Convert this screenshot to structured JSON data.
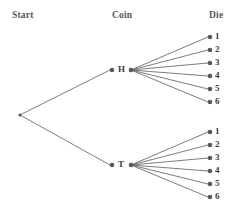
{
  "diagram": {
    "type": "probability-tree",
    "title_row": {
      "start": "Start",
      "coin": "Coin",
      "die": "Die"
    },
    "colors": {
      "edge": "#6d6d72",
      "node": "#58585c",
      "header_text": "#58585a",
      "label_text": "#3a3a3c",
      "background": "#ffffff"
    },
    "root": {
      "name": "start-node",
      "x": 20,
      "y": 115
    },
    "coin_branches": [
      {
        "label": "H",
        "node_x": 112,
        "node_y": 70,
        "fan_x": 131,
        "fan_y": 70,
        "die_outcomes": [
          {
            "label": "1",
            "x": 210,
            "y": 37
          },
          {
            "label": "2",
            "x": 210,
            "y": 50
          },
          {
            "label": "3",
            "x": 210,
            "y": 63
          },
          {
            "label": "4",
            "x": 210,
            "y": 76
          },
          {
            "label": "5",
            "x": 210,
            "y": 89
          },
          {
            "label": "6",
            "x": 210,
            "y": 102
          }
        ]
      },
      {
        "label": "T",
        "node_x": 112,
        "node_y": 165,
        "fan_x": 131,
        "fan_y": 165,
        "die_outcomes": [
          {
            "label": "1",
            "x": 210,
            "y": 132
          },
          {
            "label": "2",
            "x": 210,
            "y": 145
          },
          {
            "label": "3",
            "x": 210,
            "y": 158
          },
          {
            "label": "4",
            "x": 210,
            "y": 171
          },
          {
            "label": "5",
            "x": 210,
            "y": 184
          },
          {
            "label": "6",
            "x": 210,
            "y": 197
          }
        ]
      }
    ]
  }
}
